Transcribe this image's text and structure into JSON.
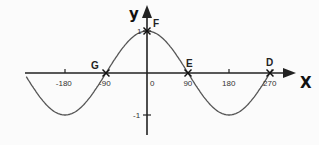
{
  "axes": {
    "x_name": "X",
    "y_name": "y",
    "x_ticks": [
      {
        "value": -180,
        "label": "-180"
      },
      {
        "value": -90,
        "label": "-90"
      },
      {
        "value": 0,
        "label": "0"
      },
      {
        "value": 90,
        "label": "90"
      },
      {
        "value": 180,
        "label": "180"
      },
      {
        "value": 270,
        "label": "270"
      }
    ],
    "y_ticks": [
      {
        "value": 1,
        "label": "1"
      },
      {
        "value": -1,
        "label": "-1"
      }
    ]
  },
  "points": [
    {
      "name": "F",
      "x": 0,
      "y": 1
    },
    {
      "name": "G",
      "x": -90,
      "y": 0
    },
    {
      "name": "E",
      "x": 90,
      "y": 0
    },
    {
      "name": "D",
      "x": 270,
      "y": 0
    }
  ],
  "curve": {
    "function": "y = cos(x)",
    "x_from": -265,
    "x_to": 275,
    "color": "#555555"
  },
  "chart_data": {
    "type": "line",
    "title": "",
    "xlabel": "X",
    "ylabel": "y",
    "xlim": [
      -265,
      285
    ],
    "ylim": [
      -1.3,
      1.5
    ],
    "grid": false,
    "series": [
      {
        "name": "y = cos x",
        "x": [
          -265,
          -180,
          -90,
          0,
          90,
          180,
          270
        ],
        "values": [
          -0.09,
          -1,
          0,
          1,
          0,
          -1,
          0
        ]
      }
    ],
    "annotations": [
      {
        "label": "F",
        "x": 0,
        "y": 1
      },
      {
        "label": "G",
        "x": -90,
        "y": 0
      },
      {
        "label": "E",
        "x": 90,
        "y": 0
      },
      {
        "label": "D",
        "x": 270,
        "y": 0
      }
    ]
  }
}
